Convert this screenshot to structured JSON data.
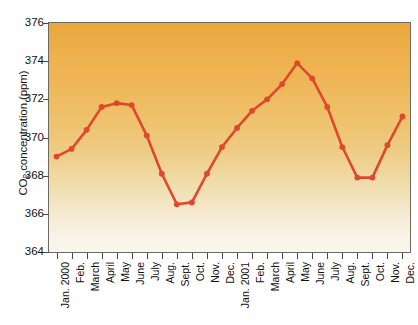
{
  "chart_data": {
    "type": "line",
    "title": "",
    "subtitle": "",
    "xlabel": "",
    "ylabel": "CO2 concentration (ppm)",
    "ylabel_rich": {
      "pre": "CO",
      "sub": "2",
      "post": " concentration (ppm)"
    },
    "ylim": [
      364,
      376
    ],
    "yticks": [
      376,
      374,
      372,
      370,
      368,
      366,
      364
    ],
    "ytick_labels": [
      "376",
      "374",
      "372",
      "370",
      "368",
      "366",
      "364"
    ],
    "grid": false,
    "legend": null,
    "legend_position": "none",
    "categories": [
      "Jan. 2000",
      "Feb.",
      "March",
      "April",
      "May",
      "June",
      "July",
      "Aug.",
      "Sept.",
      "Oct.",
      "Nov.",
      "Dec.",
      "Jan. 2001",
      "Feb.",
      "March",
      "April",
      "May",
      "June",
      "July",
      "Aug.",
      "Sept.",
      "Oct.",
      "Nov.",
      "Dec."
    ],
    "values": [
      369.0,
      369.4,
      370.4,
      371.6,
      371.8,
      371.7,
      370.1,
      368.1,
      366.5,
      366.6,
      368.1,
      369.5,
      370.5,
      371.4,
      372.0,
      372.8,
      373.9,
      373.1,
      371.6,
      369.5,
      367.9,
      367.9,
      369.6,
      371.1
    ],
    "series": [
      {
        "name": "CO2 concentration",
        "values": [
          369.0,
          369.4,
          370.4,
          371.6,
          371.8,
          371.7,
          370.1,
          368.1,
          366.5,
          366.6,
          368.1,
          369.5,
          370.5,
          371.4,
          372.0,
          372.8,
          373.9,
          373.1,
          371.6,
          369.5,
          367.9,
          367.9,
          369.6,
          371.1
        ],
        "color": "#e0482e",
        "marker": "circle"
      }
    ],
    "colors": {
      "line": "#e0482e",
      "marker": "#e0482e",
      "plot_bg_top": "#e9a73c",
      "plot_bg_bottom": "#f9f6ef",
      "frame": "#6d6a64",
      "text": "#111111"
    }
  }
}
